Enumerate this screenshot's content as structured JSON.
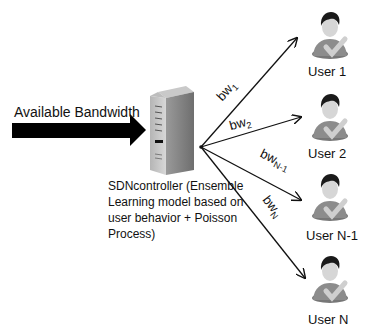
{
  "diagram": {
    "input": {
      "label": "Available Bandwidth",
      "icon": "thick-arrow-right"
    },
    "controller": {
      "icon": "server-tower-icon",
      "label_lines": [
        "SDNcontroller (Ensemble",
        "Learning model based on",
        "user behavior + Poisson",
        "Process)"
      ]
    },
    "links": [
      {
        "base": "bw",
        "sub": "1",
        "target": "User 1"
      },
      {
        "base": "bw",
        "sub": "2",
        "target": "User 2"
      },
      {
        "base": "bw",
        "sub": "N-1",
        "target": "User N-1"
      },
      {
        "base": "bw",
        "sub": "N",
        "target": "User N"
      }
    ],
    "users": [
      {
        "label": "User 1",
        "icon": "user-check-icon"
      },
      {
        "label": "User 2",
        "icon": "user-check-icon"
      },
      {
        "label": "User N-1",
        "icon": "user-check-icon"
      },
      {
        "label": "User N",
        "icon": "user-check-icon"
      }
    ],
    "colors": {
      "arrow": "#000000",
      "server": "#8a8a8a",
      "user_body": "#8c8c8c",
      "user_hair": "#1a1a1a",
      "check": "#c8c8c8"
    }
  }
}
